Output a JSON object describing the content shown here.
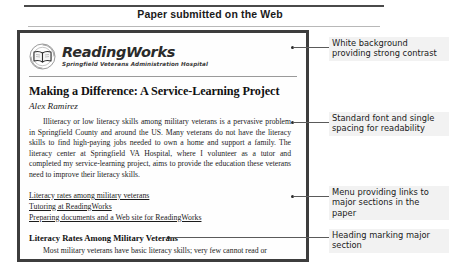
{
  "caption": {
    "title": "Paper submitted on the Web"
  },
  "document": {
    "masthead": {
      "logo_icon": "open-book-seal-icon",
      "brand_name": "ReadingWorks",
      "brand_subtitle": "Springfield Veterans Administration Hospital"
    },
    "article": {
      "title": "Making a Difference: A Service-Learning Project",
      "author": "Alex Ramirez",
      "body": "Illiteracy or low literacy skills among military veterans is a pervasive problem in Springfield County and around the US. Many veterans do not have the literacy skills to find high-paying jobs needed to own a home and support a family. The literacy center at Springfield VA Hospital, where I volunteer as a tutor and completed my service-learning project, aims to provide the education these veterans need to improve their literacy skills."
    },
    "menu_links": [
      "Literacy rates among military veterans",
      "Tutoring at ReadingWorks",
      "Preparing documents and a Web site for ReadingWorks"
    ],
    "section": {
      "heading": "Literacy Rates Among Military Veterans",
      "body": "Most military veterans have basic literacy skills; very few cannot read or"
    }
  },
  "annotations": [
    {
      "id": "white-background",
      "text": "White background providing strong contrast"
    },
    {
      "id": "standard-font",
      "text": "Standard font and single spacing for readability"
    },
    {
      "id": "menu-links",
      "text": "Menu providing links to major sections in the paper"
    },
    {
      "id": "heading-marker",
      "text": "Heading marking major section"
    }
  ],
  "colors": {
    "frame_border": "#3d3d3d",
    "rule": "#4a4a4a",
    "annotation_bg": "#f2f2f2",
    "text": "#1c1c1c"
  }
}
